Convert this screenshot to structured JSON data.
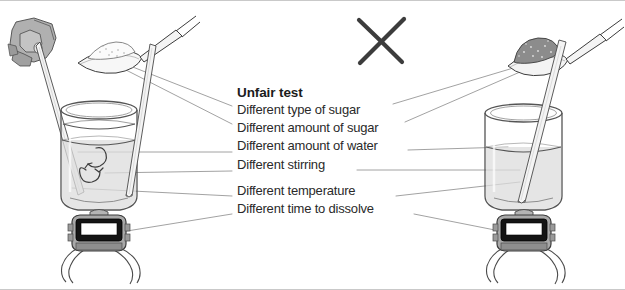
{
  "diagram": {
    "title": "Unfair test",
    "cross_mark": "x-mark",
    "items": [
      {
        "text": "Different type of sugar",
        "gap_above": false
      },
      {
        "text": "Different amount of sugar",
        "gap_above": false
      },
      {
        "text": "Different amount of water",
        "gap_above": false
      },
      {
        "text": "Different stirring",
        "gap_above": false
      },
      {
        "text": "Different temperature",
        "gap_above": true
      },
      {
        "text": "Different time to dissolve",
        "gap_above": false
      }
    ],
    "left_setup": {
      "name": "left-experiment",
      "hand": "hand-icon",
      "spoon": "spoon-white-sugar-icon",
      "beaker": "beaker-icon",
      "thermometer": "thermometer-rod-icon",
      "stirring_rod": "stirring-rod-icon",
      "stir_arrow": "stir-swirl-icon",
      "stopwatch": "stopwatch-icon"
    },
    "right_setup": {
      "name": "right-experiment",
      "spoon": "spoon-brown-sugar-icon",
      "beaker": "beaker-icon",
      "thermometer": "thermometer-rod-icon",
      "stopwatch": "stopwatch-icon"
    },
    "colors": {
      "ink": "#2a2a2a",
      "leader_line": "#8a8a8a",
      "glass": "#6e6e6e",
      "water": "#d6d6d6",
      "white_sugar": "#f2f2f2",
      "brown_sugar": "#8f8f8f",
      "hand": "#a8a8a8",
      "stopwatch_body": "#9a9a9a",
      "stopwatch_bezel": "#1a1a1a",
      "stopwatch_screen": "#ffffff",
      "frame": "#c9c9c9",
      "background": "#ffffff"
    }
  }
}
